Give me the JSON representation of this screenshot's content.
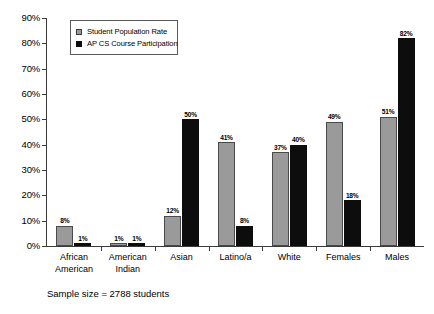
{
  "chart_data": {
    "type": "bar",
    "title": "",
    "subtitle": "",
    "xlabel": "",
    "ylabel": "",
    "ylim": [
      0,
      90
    ],
    "y_tick_labels": [
      "0%",
      "10%",
      "20%",
      "30%",
      "40%",
      "50%",
      "60%",
      "70%",
      "80%",
      "90%"
    ],
    "y_tick_values": [
      0,
      10,
      20,
      30,
      40,
      50,
      60,
      70,
      80,
      90
    ],
    "grid": false,
    "legend_position": "top-left-inside",
    "categories": [
      "African American",
      "American Indian",
      "Asian",
      "Latino/a",
      "White",
      "Females",
      "Males"
    ],
    "category_lines": [
      [
        "African",
        "American"
      ],
      [
        "American",
        "Indian"
      ],
      [
        "Asian"
      ],
      [
        "Latino/a"
      ],
      [
        "White"
      ],
      [
        "Females"
      ],
      [
        "Males"
      ]
    ],
    "series": [
      {
        "name": "Student Population Rate",
        "color": "#9a9a9a",
        "values": [
          8,
          1,
          12,
          41,
          37,
          49,
          51
        ],
        "value_labels": [
          "8%",
          "1%",
          "12%",
          "41%",
          "37%",
          "49%",
          "51%"
        ]
      },
      {
        "name": "AP CS Course Participation",
        "color": "#0d0d0d",
        "values": [
          1,
          1,
          50,
          8,
          40,
          18,
          82
        ],
        "value_labels": [
          "1%",
          "1%",
          "50%",
          "8%",
          "40%",
          "18%",
          "82%"
        ]
      }
    ],
    "annotations": [
      "Sample size = 2788 students"
    ]
  },
  "legend": {
    "items": [
      {
        "label": "Student Population Rate",
        "swatch": "gray-square-swatch"
      },
      {
        "label": "AP CS Course Participation",
        "swatch": "black-square-swatch"
      }
    ]
  },
  "caption": {
    "text": "Sample size = 2788 students"
  }
}
